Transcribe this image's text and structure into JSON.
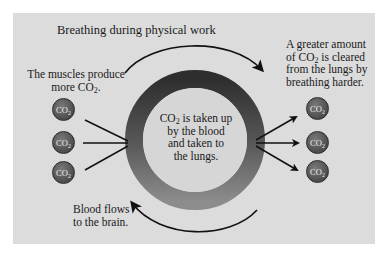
{
  "diagram": {
    "title": "Breathing during physical work",
    "left_label": {
      "line1": "The muscles produce",
      "line2_prefix": "more CO",
      "line2_sub": "2",
      "line2_suffix": "."
    },
    "right_label": {
      "line1": "A greater amount",
      "line2_prefix": "of CO",
      "line2_sub": "2",
      "line2_suffix": " is cleared",
      "line3": "from the lungs by",
      "line4": "breathing harder."
    },
    "center_label": {
      "line1_prefix": "CO",
      "line1_sub": "2",
      "line1_suffix": " is taken up",
      "line2": "by the blood",
      "line3": "and taken to",
      "line4": "the lungs."
    },
    "bottom_label": {
      "line1": "Blood flows",
      "line2": "to the brain."
    },
    "molecule": {
      "main": "CO",
      "sub": "2"
    },
    "colors": {
      "panel": "#dcdcdc",
      "ring_dark": "#2e2e2e",
      "ring_light": "#8a8a8a",
      "inner_circle": "#d6d6d6",
      "molecule": "#555555",
      "arrow": "#111111"
    }
  }
}
